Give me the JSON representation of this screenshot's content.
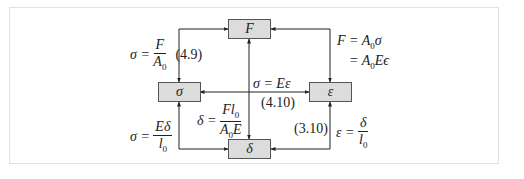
{
  "diagram": {
    "nodes": [
      {
        "id": "F",
        "label": "F"
      },
      {
        "id": "sigma",
        "label": "σ"
      },
      {
        "id": "epsilon",
        "label": "ε"
      },
      {
        "id": "delta",
        "label": "δ"
      }
    ],
    "edges": {
      "F_to_sigma": {
        "lhs": "σ =",
        "num": "F",
        "den": "A",
        "den_sub": "0",
        "ref": "(4.9)"
      },
      "epsilon_to_F": {
        "line1_lhs": "F = A",
        "line1_sub": "0",
        "line1_rhs": "σ",
        "line2_lhs": "= A",
        "line2_sub": "0",
        "line2_rhs": "Eϵ"
      },
      "sigma_epsilon": {
        "eq": "σ = Eε",
        "ref": "(4.10)"
      },
      "F_to_delta": {
        "lhs": "δ =",
        "num": "Fl",
        "num_sub": "0",
        "den": "A",
        "den_sub": "0",
        "den_rhs": "E"
      },
      "delta_to_sigma": {
        "lhs": "σ =",
        "num": "Eδ",
        "den": "l",
        "den_sub": "0"
      },
      "delta_to_epsilon": {
        "ref": "(3.10)",
        "lhs": "ε =",
        "num": "δ",
        "den": "l",
        "den_sub": "0"
      }
    },
    "colors": {
      "box_fill": "#dcdcdc",
      "box_border": "#555555",
      "line": "#222222",
      "frame": "#e2e2e2"
    }
  }
}
